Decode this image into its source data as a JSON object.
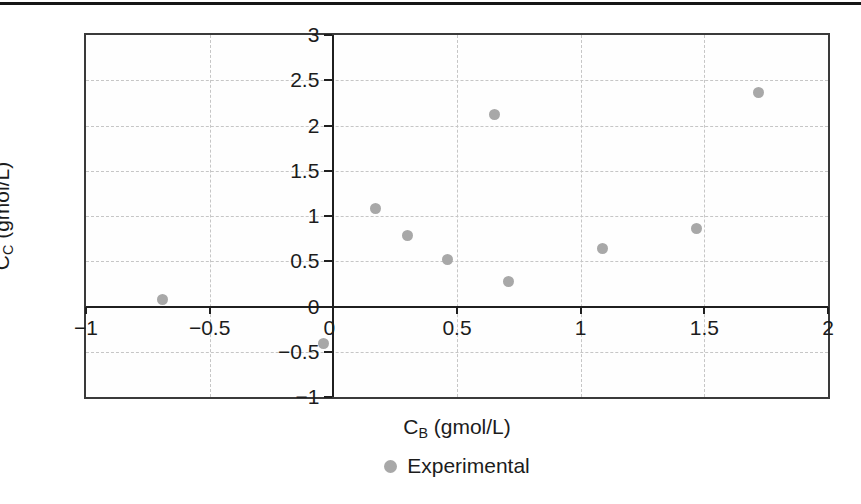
{
  "page": {
    "top_rule_color": "#151515",
    "background": "#ffffff"
  },
  "chart_data": {
    "type": "scatter",
    "title": "",
    "xlabel": {
      "main": "C",
      "sub": "B",
      "rest": " (gmol/L)"
    },
    "ylabel": {
      "main": "C",
      "sub": "C",
      "rest": " (gmol/L)"
    },
    "xlim": [
      -1,
      2
    ],
    "ylim": [
      -1,
      3
    ],
    "x_ticks": [
      -1,
      -0.5,
      0,
      0.5,
      1,
      1.5,
      2
    ],
    "x_tick_labels": [
      "−1",
      "−0.5",
      "0",
      "0.5",
      "1",
      "1.5",
      "2"
    ],
    "y_ticks": [
      -1,
      -0.5,
      0,
      0.5,
      1,
      1.5,
      2,
      2.5,
      3
    ],
    "y_tick_labels": [
      "−1",
      "−0.5",
      "0",
      "0.5",
      "1",
      "1.5",
      "2",
      "2.5",
      "3"
    ],
    "grid": true,
    "legend_position": "bottom-center",
    "legend": [
      {
        "label": "Experimental",
        "marker": "circle",
        "marker_color": "#a8a8a8"
      }
    ],
    "series": [
      {
        "name": "Experimental",
        "marker_color": "#a8a8a8",
        "points": [
          {
            "x": -0.69,
            "y": 0.08
          },
          {
            "x": -0.04,
            "y": -0.41
          },
          {
            "x": 0.17,
            "y": 1.08
          },
          {
            "x": 0.3,
            "y": 0.78
          },
          {
            "x": 0.46,
            "y": 0.52
          },
          {
            "x": 0.65,
            "y": 2.12
          },
          {
            "x": 0.71,
            "y": 0.28
          },
          {
            "x": 1.09,
            "y": 0.64
          },
          {
            "x": 1.47,
            "y": 0.86
          },
          {
            "x": 1.72,
            "y": 2.37
          }
        ]
      }
    ],
    "colors": {
      "gridline": "#c6c6c6",
      "axis": "#1f1f1f",
      "frame": "#3a3a3a",
      "point": "#a8a8a8",
      "text": "#1c1c1c"
    }
  }
}
